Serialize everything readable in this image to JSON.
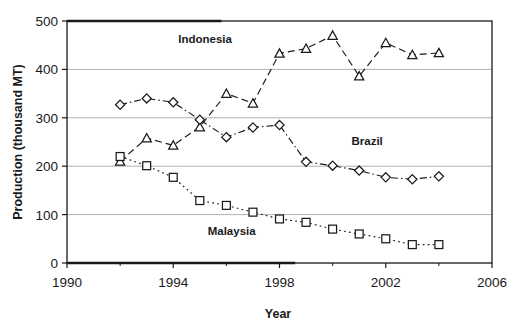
{
  "figure": {
    "top_cut_text": "",
    "background_color": "#ffffff",
    "ink_color": "#1a1a1a",
    "gridline_color": "#b0b0b0"
  },
  "chart_data": {
    "type": "line",
    "title": "",
    "xlabel": "Year",
    "ylabel": "Production (thousand MT)",
    "xlim": [
      1990,
      2006
    ],
    "ylim": [
      0,
      500
    ],
    "xticks": [
      1990,
      1994,
      1998,
      2002,
      2006
    ],
    "xtick_labels": [
      "1990",
      "1994",
      "1998",
      "2002",
      "2006"
    ],
    "xticks_minor": [
      1992,
      1996,
      2000,
      2004
    ],
    "yticks": [
      0,
      100,
      200,
      300,
      400,
      500
    ],
    "ytick_labels": [
      "0",
      "100",
      "200",
      "300",
      "400",
      "500"
    ],
    "grid": "horizontal",
    "legend_position": "inline-annotations",
    "x": [
      1992,
      1993,
      1994,
      1995,
      1996,
      1997,
      1998,
      1999,
      2000,
      2001,
      2002,
      2003,
      2004
    ],
    "series": [
      {
        "name": "Indonesia",
        "marker": "triangle",
        "line_style": "dashed",
        "label_x": 1995.2,
        "label_y": 455,
        "values": [
          210,
          258,
          243,
          281,
          350,
          330,
          433,
          443,
          470,
          386,
          455,
          430,
          434
        ]
      },
      {
        "name": "Brazil",
        "marker": "diamond",
        "line_style": "dash-dot",
        "label_x": 2001.3,
        "label_y": 243,
        "values": [
          327,
          340,
          332,
          296,
          260,
          280,
          285,
          209,
          201,
          191,
          177,
          173,
          179
        ]
      },
      {
        "name": "Malaysia",
        "marker": "square",
        "line_style": "dotted",
        "label_x": 1996.2,
        "label_y": 58,
        "values": [
          220,
          201,
          177,
          129,
          119,
          105,
          91,
          84,
          70,
          60,
          50,
          38,
          38
        ]
      }
    ]
  }
}
